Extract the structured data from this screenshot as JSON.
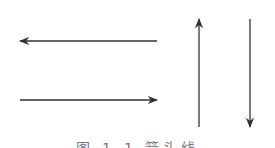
{
  "figure": {
    "caption": "图 1-1  箭头线",
    "stroke_color": "#333333",
    "arrows": [
      {
        "name": "left-arrow",
        "direction": "left",
        "x1": 157,
        "y1": 41,
        "x2": 20,
        "y2": 41
      },
      {
        "name": "right-arrow",
        "direction": "right",
        "x1": 20,
        "y1": 100,
        "x2": 157,
        "y2": 100
      },
      {
        "name": "up-arrow",
        "direction": "up",
        "x1": 199,
        "y1": 127,
        "x2": 199,
        "y2": 19
      },
      {
        "name": "down-arrow",
        "direction": "down",
        "x1": 250,
        "y1": 19,
        "x2": 250,
        "y2": 127
      }
    ]
  }
}
